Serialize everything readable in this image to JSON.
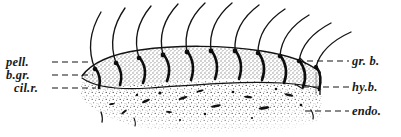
{
  "figure": {
    "background_color": "#ffffff",
    "ink_color": "#1a1a1a",
    "alveolus_fill": "#c9c9c9",
    "endoplasm_stipple_color": "#2b2b2b"
  },
  "labels": {
    "left": [
      {
        "id": "pell",
        "text": "pell.",
        "meaning": "pellicle"
      },
      {
        "id": "b_gr",
        "text": "b.gr.",
        "meaning": "basal granule"
      },
      {
        "id": "cil_r",
        "text": "cil.r.",
        "meaning": "ciliary rootlet"
      }
    ],
    "right": [
      {
        "id": "gr_b",
        "text": "gr. b.",
        "meaning": "granular body"
      },
      {
        "id": "hy_b",
        "text": "hy.b.",
        "meaning": "hyaline body"
      },
      {
        "id": "endo",
        "text": "endo.",
        "meaning": "endoplasm"
      }
    ]
  },
  "diagram": {
    "cilia_count": 11,
    "alveoli_count": 11,
    "leader_lines": {
      "style": "dashed",
      "left_count": 3,
      "right_count": 3
    }
  }
}
